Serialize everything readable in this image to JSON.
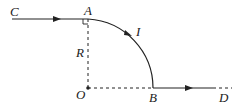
{
  "diagram": {
    "labels": {
      "C": "C",
      "A": "A",
      "I": "I",
      "R": "R",
      "O": "O",
      "B": "B",
      "D": "D"
    },
    "colors": {
      "stroke": "#222222",
      "background": "#ffffff"
    }
  }
}
